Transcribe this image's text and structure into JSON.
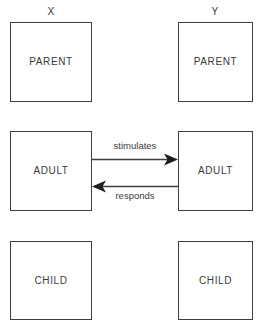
{
  "diagram": {
    "type": "transactional-analysis-ego-state-diagram",
    "background_color": "#ffffff",
    "line_color": "#3f3f3f",
    "text_color": "#3a3a3a",
    "columns": [
      {
        "header": "X",
        "ego_states": [
          {
            "label": "PARENT"
          },
          {
            "label": "ADULT"
          },
          {
            "label": "CHILD"
          }
        ]
      },
      {
        "header": "Y",
        "ego_states": [
          {
            "label": "PARENT"
          },
          {
            "label": "ADULT"
          },
          {
            "label": "CHILD"
          }
        ]
      }
    ],
    "transactions": [
      {
        "label": "stimulates",
        "from": "X ADULT",
        "to": "Y ADULT",
        "direction": "left-to-right"
      },
      {
        "label": "responds",
        "from": "Y ADULT",
        "to": "X ADULT",
        "direction": "right-to-left"
      }
    ]
  }
}
